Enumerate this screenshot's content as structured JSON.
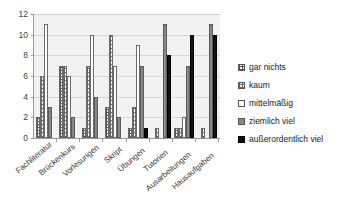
{
  "chart_data": {
    "type": "bar",
    "title": "",
    "xlabel": "",
    "ylabel": "",
    "ylim": [
      0,
      12
    ],
    "yticks": [
      0,
      2,
      4,
      6,
      8,
      10,
      12
    ],
    "grid": true,
    "legend_position": "right",
    "categories": [
      "Fachliteratur",
      "Brückenkurs",
      "Vorlesungen",
      "Skript",
      "Übungen",
      "Tutorien",
      "Ausarbeitungen",
      "Hausaufgaben"
    ],
    "series": [
      {
        "name": "gar nichts",
        "values": [
          2,
          7,
          1,
          3,
          1,
          0,
          1,
          0
        ]
      },
      {
        "name": "kaum",
        "values": [
          6,
          7,
          7,
          10,
          3,
          1,
          1,
          1
        ]
      },
      {
        "name": "mittelmäßig",
        "values": [
          11,
          6,
          10,
          7,
          9,
          0,
          2,
          0
        ]
      },
      {
        "name": "ziemlich viel",
        "values": [
          3,
          2,
          4,
          2,
          7,
          11,
          7,
          11
        ]
      },
      {
        "name": "außerordentlich viel",
        "values": [
          0,
          0,
          0,
          0,
          1,
          8,
          10,
          10
        ]
      }
    ]
  },
  "legend": {
    "items": [
      {
        "label": "gar nichts"
      },
      {
        "label": "kaum"
      },
      {
        "label": "mittelmäßig"
      },
      {
        "label": "ziemlich viel"
      },
      {
        "label": "außerordentlich viel"
      }
    ]
  }
}
